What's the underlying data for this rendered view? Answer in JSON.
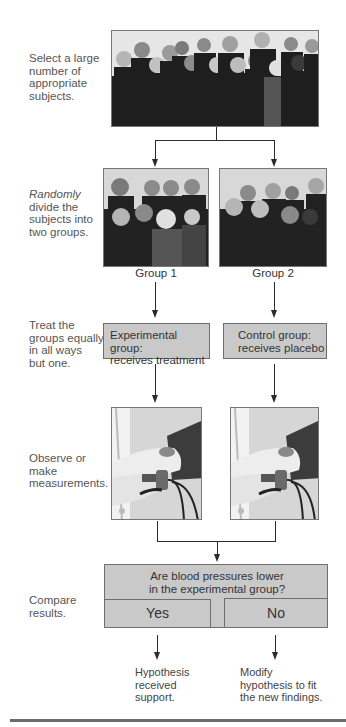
{
  "steps": [
    {
      "id": "select",
      "lines": [
        "Select a large",
        "number of",
        "appropriate",
        "subjects."
      ]
    },
    {
      "id": "divide",
      "emphasis": "Randomly",
      "lines": [
        "divide the",
        "subjects into",
        "two groups."
      ]
    },
    {
      "id": "treat",
      "lines": [
        "Treat the",
        "groups equally",
        "in all ways",
        "but one."
      ]
    },
    {
      "id": "observe",
      "lines": [
        "Observe or",
        "make",
        "measurements."
      ]
    },
    {
      "id": "compare",
      "lines": [
        "Compare",
        "results."
      ]
    }
  ],
  "images": {
    "all_subjects": "crowd-photo",
    "group1_photo": "group-1-photo",
    "group2_photo": "group-2-photo",
    "measure_left": "blood-pressure-cuff-photo",
    "measure_right": "blood-pressure-cuff-photo"
  },
  "groups": {
    "group1": "Group 1",
    "group2": "Group 2"
  },
  "treatments": {
    "experimental": [
      "Experimental group:",
      "receives treatment"
    ],
    "control": [
      "Control group:",
      "receives placebo"
    ]
  },
  "question": {
    "lines": [
      "Are blood pressures lower",
      "in the experimental group?"
    ],
    "yes": "Yes",
    "no": "No"
  },
  "outcomes": {
    "yes": [
      "Hypothesis",
      "received",
      "support."
    ],
    "no": [
      "Modify",
      "hypothesis to fit",
      "the new findings."
    ]
  },
  "colors": {
    "box_fill": "#c9c9c9",
    "box_border": "#6e6e6e",
    "arrow": "#2b2b2b",
    "text": "#4a4a4a"
  }
}
